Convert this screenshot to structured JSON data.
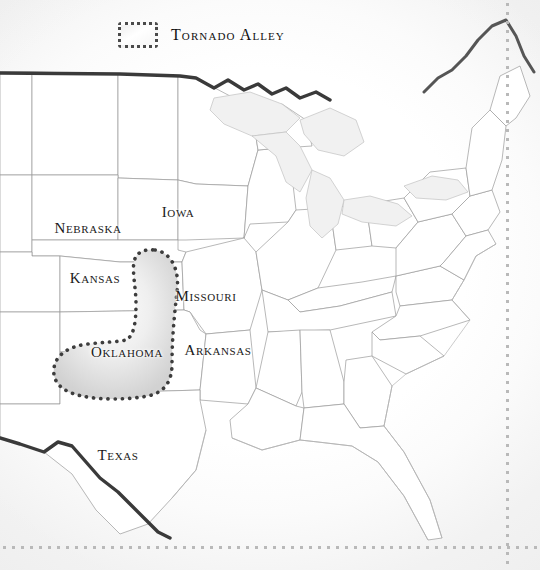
{
  "map": {
    "title": "Tornado Alley map of the central and eastern United States",
    "background_color": "#ffffff",
    "legend": {
      "label": "Tornado Alley",
      "swatch_name": "tornado-alley-swatch",
      "swatch_border_color": "#4a4a4a",
      "swatch_fill_color": "#f1f1f1",
      "swatch_border_style": "dotted"
    },
    "region": {
      "name": "Tornado Alley",
      "outline_style": "dotted",
      "outline_color": "#3d3d3d",
      "fill_color": "#e3e3e3",
      "covers": [
        "Oklahoma",
        "Kansas",
        "Texas Panhandle"
      ]
    },
    "state_labels": [
      {
        "name": "Nebraska",
        "label": "Nebraska",
        "x": 88,
        "y": 228
      },
      {
        "name": "Iowa",
        "label": "Iowa",
        "x": 178,
        "y": 212
      },
      {
        "name": "Kansas",
        "label": "Kansas",
        "x": 95,
        "y": 278
      },
      {
        "name": "Missouri",
        "label": "Missouri",
        "x": 206,
        "y": 296
      },
      {
        "name": "Oklahoma",
        "label": "Oklahoma",
        "x": 127,
        "y": 352
      },
      {
        "name": "Arkansas",
        "label": "Arkansas",
        "x": 218,
        "y": 350
      },
      {
        "name": "Texas",
        "label": "Texas",
        "x": 118,
        "y": 455
      }
    ],
    "borders": {
      "national_border_color": "#3a3a3a",
      "state_border_color": "#9a9a9a",
      "coastline_color": "#b4b4b4",
      "lake_fill_color": "#f1f1f1"
    },
    "decoration": {
      "dot_rule_color": "#b9b9b9",
      "vertical_rule_position": "right",
      "horizontal_rule_position": "bottom"
    }
  }
}
